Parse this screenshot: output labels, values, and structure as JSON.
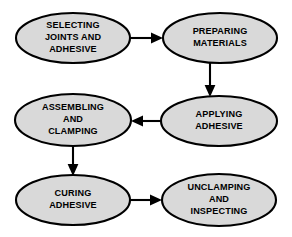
{
  "diagram": {
    "background_color": "#ffffff",
    "node_fill_color": "#d9d9d9",
    "node_stroke_color": "#000000",
    "text_color": "#000000",
    "arrow_color": "#000000",
    "nodes": [
      {
        "id": "selecting-joints-and-adhesive",
        "lines": [
          "SELECTING",
          "JOINTS AND",
          "ADHESIVE"
        ],
        "line1": "SELECTING",
        "line2": "JOINTS AND",
        "line3": "ADHESIVE",
        "cx": 73,
        "cy": 38,
        "rx": 57,
        "ry": 25
      },
      {
        "id": "preparing-materials",
        "lines": [
          "PREPARING",
          "MATERIALS"
        ],
        "line1": "PREPARING",
        "line2": "MATERIALS",
        "cx": 220,
        "cy": 38,
        "rx": 57,
        "ry": 25
      },
      {
        "id": "applying-adhesive",
        "lines": [
          "APPLYING",
          "ADHESIVE"
        ],
        "line1": "APPLYING",
        "line2": "ADHESIVE",
        "cx": 219,
        "cy": 121,
        "rx": 58,
        "ry": 25
      },
      {
        "id": "assembling-and-clamping",
        "lines": [
          "ASSEMBLING",
          "AND",
          "CLAMPING"
        ],
        "line1": "ASSEMBLING",
        "line2": "AND",
        "line3": "CLAMPING",
        "cx": 73,
        "cy": 120,
        "rx": 58,
        "ry": 26
      },
      {
        "id": "curing-adhesive",
        "lines": [
          "CURING",
          "ADHESIVE"
        ],
        "line1": "CURING",
        "line2": "ADHESIVE",
        "cx": 73,
        "cy": 200,
        "rx": 57,
        "ry": 25
      },
      {
        "id": "unclamping-and-inspecting",
        "lines": [
          "UNCLAMPING",
          "AND",
          "INSPECTING"
        ],
        "line1": "UNCLAMPING",
        "line2": "AND",
        "line3": "INSPECTING",
        "cx": 219,
        "cy": 200,
        "rx": 57,
        "ry": 26
      }
    ],
    "edges": [
      {
        "id": "selecting-to-preparing",
        "from": "selecting-joints-and-adhesive",
        "to": "preparing-materials",
        "direction": "right"
      },
      {
        "id": "preparing-to-applying",
        "from": "preparing-materials",
        "to": "applying-adhesive",
        "direction": "down"
      },
      {
        "id": "applying-to-assembling",
        "from": "applying-adhesive",
        "to": "assembling-and-clamping",
        "direction": "left"
      },
      {
        "id": "assembling-to-curing",
        "from": "assembling-and-clamping",
        "to": "curing-adhesive",
        "direction": "down"
      },
      {
        "id": "curing-to-unclamping",
        "from": "curing-adhesive",
        "to": "unclamping-and-inspecting",
        "direction": "right"
      }
    ]
  }
}
